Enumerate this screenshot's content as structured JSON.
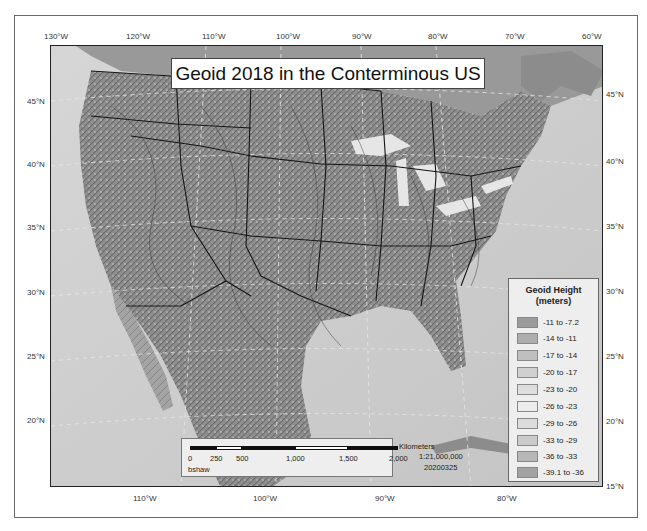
{
  "title": "Geoid 2018 in the Conterminous US",
  "top_lon_ticks": [
    "130°W",
    "120°W",
    "110°W",
    "100°W",
    "90°W",
    "80°W",
    "70°W",
    "60°W"
  ],
  "bottom_lon_ticks": [
    "110°W",
    "100°W",
    "90°W",
    "80°W"
  ],
  "left_lat_ticks": [
    "45°N",
    "40°N",
    "35°N",
    "30°N",
    "25°N",
    "20°N"
  ],
  "right_lat_ticks": [
    "45°N",
    "40°N",
    "35°N",
    "30°N",
    "25°N",
    "20°N",
    "15°N"
  ],
  "legend": {
    "title_line1": "Geoid Height",
    "title_line2": "(meters)",
    "items": [
      {
        "label": "-11 to -7.2",
        "color": "#9a9a9a"
      },
      {
        "label": "-14 to -11",
        "color": "#adadad"
      },
      {
        "label": "-17 to -14",
        "color": "#bfbfbf"
      },
      {
        "label": "-20 to -17",
        "color": "#d0d0d0"
      },
      {
        "label": "-23 to -20",
        "color": "#dedede"
      },
      {
        "label": "-26 to -23",
        "color": "#ececec"
      },
      {
        "label": "-29 to -26",
        "color": "#dcdcdc"
      },
      {
        "label": "-33 to -29",
        "color": "#cacaca"
      },
      {
        "label": "-36 to -33",
        "color": "#b7b7b7"
      },
      {
        "label": "-39.1 to -36",
        "color": "#a2a2a2"
      }
    ]
  },
  "scale_bar": {
    "unit": "Kilometers",
    "ticks": [
      "0",
      "250",
      "500",
      "1,000",
      "1,500",
      "2,000"
    ],
    "scale": "1:21,000,000",
    "author": "bshaw",
    "date": "20200325"
  }
}
